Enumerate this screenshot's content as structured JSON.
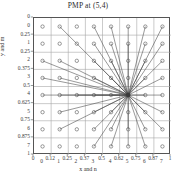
{
  "chart_data": {
    "type": "scatter",
    "title": "PMP at (5,4)",
    "xlabel": "x and n",
    "ylabel": "y and m",
    "grid": true,
    "legend": null,
    "xlim": [
      0,
      1
    ],
    "ylim": [
      0,
      1
    ],
    "y_axis_inverted": true,
    "x_fraction_ticks": [
      "0",
      "0.12",
      "0.25",
      "0.37",
      "0.5",
      "0.62",
      "0.75",
      "0.87",
      "1"
    ],
    "x_integer_ticks": [
      "0",
      "1",
      "2",
      "3",
      "4",
      "5",
      "6",
      "7"
    ],
    "y_fraction_ticks": [
      "0",
      "0.25",
      "0.25",
      "0.375",
      "0.5",
      "0.625",
      "0.75",
      "0.875",
      "1"
    ],
    "y_integer_ticks": [
      "0",
      "1",
      "2",
      "3",
      "4",
      "5",
      "6",
      "7"
    ],
    "grid_columns": 8,
    "grid_rows": 8,
    "marker_style": "open-circle",
    "marker_color": "#555555",
    "line_color": "#444444",
    "grid_color": "#a8a8a8",
    "frame_color": "#555555",
    "center_point": {
      "n": 5,
      "m": 4,
      "label": "PMP at (5,4)"
    },
    "points": [
      {
        "n": 0,
        "m": 0
      },
      {
        "n": 1,
        "m": 0
      },
      {
        "n": 2,
        "m": 0
      },
      {
        "n": 3,
        "m": 0
      },
      {
        "n": 4,
        "m": 0
      },
      {
        "n": 5,
        "m": 0
      },
      {
        "n": 6,
        "m": 0
      },
      {
        "n": 7,
        "m": 0
      },
      {
        "n": 0,
        "m": 1
      },
      {
        "n": 1,
        "m": 1
      },
      {
        "n": 2,
        "m": 1
      },
      {
        "n": 3,
        "m": 1
      },
      {
        "n": 4,
        "m": 1
      },
      {
        "n": 5,
        "m": 1
      },
      {
        "n": 6,
        "m": 1
      },
      {
        "n": 7,
        "m": 1
      },
      {
        "n": 0,
        "m": 2
      },
      {
        "n": 1,
        "m": 2
      },
      {
        "n": 2,
        "m": 2
      },
      {
        "n": 3,
        "m": 2
      },
      {
        "n": 4,
        "m": 2
      },
      {
        "n": 5,
        "m": 2
      },
      {
        "n": 6,
        "m": 2
      },
      {
        "n": 7,
        "m": 2
      },
      {
        "n": 0,
        "m": 3
      },
      {
        "n": 1,
        "m": 3
      },
      {
        "n": 2,
        "m": 3
      },
      {
        "n": 3,
        "m": 3
      },
      {
        "n": 4,
        "m": 3
      },
      {
        "n": 5,
        "m": 3
      },
      {
        "n": 6,
        "m": 3
      },
      {
        "n": 7,
        "m": 3
      },
      {
        "n": 0,
        "m": 4
      },
      {
        "n": 1,
        "m": 4
      },
      {
        "n": 2,
        "m": 4
      },
      {
        "n": 3,
        "m": 4
      },
      {
        "n": 4,
        "m": 4
      },
      {
        "n": 5,
        "m": 4
      },
      {
        "n": 6,
        "m": 4
      },
      {
        "n": 7,
        "m": 4
      },
      {
        "n": 0,
        "m": 5
      },
      {
        "n": 1,
        "m": 5
      },
      {
        "n": 2,
        "m": 5
      },
      {
        "n": 3,
        "m": 5
      },
      {
        "n": 4,
        "m": 5
      },
      {
        "n": 5,
        "m": 5
      },
      {
        "n": 6,
        "m": 5
      },
      {
        "n": 7,
        "m": 5
      },
      {
        "n": 0,
        "m": 6
      },
      {
        "n": 1,
        "m": 6
      },
      {
        "n": 2,
        "m": 6
      },
      {
        "n": 3,
        "m": 6
      },
      {
        "n": 4,
        "m": 6
      },
      {
        "n": 5,
        "m": 6
      },
      {
        "n": 6,
        "m": 6
      },
      {
        "n": 7,
        "m": 6
      },
      {
        "n": 0,
        "m": 7
      },
      {
        "n": 1,
        "m": 7
      },
      {
        "n": 2,
        "m": 7
      },
      {
        "n": 3,
        "m": 7
      },
      {
        "n": 4,
        "m": 7
      },
      {
        "n": 5,
        "m": 7
      },
      {
        "n": 6,
        "m": 7
      },
      {
        "n": 7,
        "m": 7
      }
    ],
    "connections": [
      {
        "n": 1,
        "m": 0
      },
      {
        "n": 3,
        "m": 0
      },
      {
        "n": 4,
        "m": 0
      },
      {
        "n": 5,
        "m": 0
      },
      {
        "n": 6,
        "m": 0
      },
      {
        "n": 7,
        "m": 0
      },
      {
        "n": 3,
        "m": 1
      },
      {
        "n": 4,
        "m": 1
      },
      {
        "n": 5,
        "m": 1
      },
      {
        "n": 6,
        "m": 1
      },
      {
        "n": 7,
        "m": 1
      },
      {
        "n": 0,
        "m": 2
      },
      {
        "n": 1,
        "m": 2
      },
      {
        "n": 3,
        "m": 2
      },
      {
        "n": 4,
        "m": 2
      },
      {
        "n": 6,
        "m": 2
      },
      {
        "n": 7,
        "m": 2
      },
      {
        "n": 0,
        "m": 3
      },
      {
        "n": 1,
        "m": 3
      },
      {
        "n": 3,
        "m": 3
      },
      {
        "n": 4,
        "m": 3
      },
      {
        "n": 6,
        "m": 3
      },
      {
        "n": 7,
        "m": 3
      },
      {
        "n": 0,
        "m": 4
      },
      {
        "n": 1,
        "m": 4
      },
      {
        "n": 2,
        "m": 4
      },
      {
        "n": 3,
        "m": 4
      },
      {
        "n": 4,
        "m": 4
      },
      {
        "n": 6,
        "m": 4
      },
      {
        "n": 7,
        "m": 4
      },
      {
        "n": 1,
        "m": 5
      },
      {
        "n": 3,
        "m": 5
      },
      {
        "n": 4,
        "m": 5
      },
      {
        "n": 6,
        "m": 5
      },
      {
        "n": 7,
        "m": 5
      },
      {
        "n": 1,
        "m": 6
      },
      {
        "n": 3,
        "m": 6
      },
      {
        "n": 4,
        "m": 6
      },
      {
        "n": 5,
        "m": 6
      },
      {
        "n": 6,
        "m": 6
      },
      {
        "n": 7,
        "m": 6
      },
      {
        "n": 3,
        "m": 7
      },
      {
        "n": 4,
        "m": 7
      },
      {
        "n": 5,
        "m": 7
      },
      {
        "n": 6,
        "m": 7
      }
    ]
  }
}
